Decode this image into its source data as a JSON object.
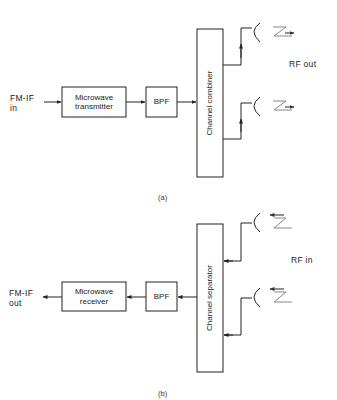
{
  "diagram_a": {
    "input_label_line1": "FM-IF",
    "input_label_line2": "in",
    "block1_line1": "Microwave",
    "block1_line2": "transmitter",
    "block2": "BPF",
    "block3": "Channel combiner",
    "output_label": "RF out",
    "caption": "(a)"
  },
  "diagram_b": {
    "output_label_line1": "FM-IF",
    "output_label_line2": "out",
    "block1_line1": "Microwave",
    "block1_line2": "receiver",
    "block2": "BPF",
    "block3": "Channel separator",
    "input_label": "RF in",
    "caption": "(b)"
  },
  "colors": {
    "line": "#222222",
    "wave": "#888888"
  }
}
